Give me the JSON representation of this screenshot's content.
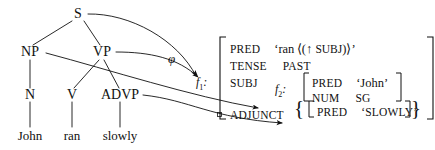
{
  "diagram": {
    "mapping_label": "φ",
    "f1_label": "f",
    "f1_sub": "1",
    "f1_colon": ":",
    "f2_label": "f",
    "f2_sub": "2",
    "f2_colon": ":"
  },
  "tree": {
    "nodes": [
      {
        "id": "S",
        "label": "S",
        "x": 78,
        "y": 14
      },
      {
        "id": "NP",
        "label": "NP",
        "x": 30,
        "y": 52
      },
      {
        "id": "VP",
        "label": "VP",
        "x": 102,
        "y": 52
      },
      {
        "id": "N",
        "label": "N",
        "x": 30,
        "y": 95
      },
      {
        "id": "V",
        "label": "V",
        "x": 72,
        "y": 95
      },
      {
        "id": "ADVP",
        "label": "ADVP",
        "x": 120,
        "y": 95
      }
    ],
    "leaves": [
      {
        "id": "John",
        "label": "John",
        "x": 30,
        "y": 135
      },
      {
        "id": "ran",
        "label": "ran",
        "x": 72,
        "y": 135
      },
      {
        "id": "slowly",
        "label": "slowly",
        "x": 120,
        "y": 135
      }
    ],
    "edges": [
      {
        "from": "S",
        "to": "NP"
      },
      {
        "from": "S",
        "to": "VP"
      },
      {
        "from": "NP",
        "to": "N"
      },
      {
        "from": "VP",
        "to": "V"
      },
      {
        "from": "VP",
        "to": "ADVP"
      },
      {
        "from": "N",
        "to": "John"
      },
      {
        "from": "V",
        "to": "ran"
      },
      {
        "from": "ADVP",
        "to": "slowly"
      }
    ]
  },
  "fstructure": {
    "rows": [
      {
        "attr": "PRED",
        "value": "‘ran ⟨(↑ SUBJ)⟩’"
      },
      {
        "attr": "TENSE",
        "value": "PAST"
      },
      {
        "attr": "SUBJ",
        "value": ""
      },
      {
        "attr": "ADJUNCT",
        "value": ""
      }
    ],
    "pred_open_quote": "‘",
    "pred_word": "ran",
    "pred_angle_open": "⟨",
    "pred_paren_open": "(",
    "pred_uparrow": "↑",
    "pred_subj": "SUBJ",
    "pred_paren_close": ")",
    "pred_angle_close": "⟩",
    "pred_close_quote": "’",
    "tense_attr": "TENSE",
    "tense_value": "PAST",
    "subj_attr": "SUBJ",
    "subj_pred_attr": "PRED",
    "subj_pred_value": "‘John’",
    "subj_num_attr": "NUM",
    "subj_num_value": "SG",
    "adjunct_attr": "ADJUNCT",
    "adjunct_set_open": "{",
    "adjunct_pred_attr": "PRED",
    "adjunct_pred_value": "‘SLOWLY’",
    "adjunct_set_close": "}",
    "pred_attr": "PRED"
  },
  "colors": {
    "ink": "#111111",
    "background": "#ffffff"
  }
}
